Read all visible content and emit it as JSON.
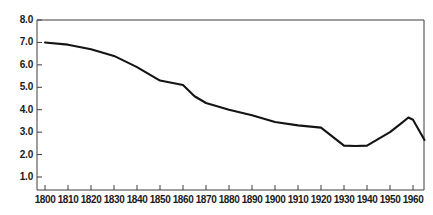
{
  "chart_data": {
    "type": "line",
    "title": "",
    "subtitle": "",
    "xlabel": "",
    "ylabel": "",
    "xlim": [
      1800,
      1965
    ],
    "ylim": [
      0.3,
      8.0
    ],
    "grid": false,
    "legend": null,
    "axis_color": "#3d3d3d",
    "line_color": "#141414",
    "background": "#ffffff",
    "yticks": [
      {
        "value": 8.0,
        "label": "8.0"
      },
      {
        "value": 7.0,
        "label": "7.0"
      },
      {
        "value": 6.0,
        "label": "6.0"
      },
      {
        "value": 5.0,
        "label": "5.0"
      },
      {
        "value": 4.0,
        "label": "4.0"
      },
      {
        "value": 3.0,
        "label": "3.0"
      },
      {
        "value": 2.0,
        "label": "2.0"
      },
      {
        "value": 1.0,
        "label": "1.0"
      }
    ],
    "xticks": [
      {
        "value": 1800,
        "label": "1800"
      },
      {
        "value": 1810,
        "label": "1810"
      },
      {
        "value": 1820,
        "label": "1820"
      },
      {
        "value": 1830,
        "label": "1830"
      },
      {
        "value": 1840,
        "label": "1840"
      },
      {
        "value": 1850,
        "label": "1850"
      },
      {
        "value": 1860,
        "label": "1860"
      },
      {
        "value": 1870,
        "label": "1870"
      },
      {
        "value": 1880,
        "label": "1880"
      },
      {
        "value": 1890,
        "label": "1890"
      },
      {
        "value": 1900,
        "label": "1900"
      },
      {
        "value": 1910,
        "label": "1910"
      },
      {
        "value": 1920,
        "label": "1920"
      },
      {
        "value": 1930,
        "label": "1930"
      },
      {
        "value": 1940,
        "label": "1940"
      },
      {
        "value": 1950,
        "label": "1950"
      },
      {
        "value": 1960,
        "label": "1960"
      }
    ],
    "series": [
      {
        "name": "rate",
        "x": [
          1800,
          1810,
          1820,
          1830,
          1840,
          1850,
          1855,
          1860,
          1865,
          1870,
          1880,
          1890,
          1900,
          1910,
          1920,
          1925,
          1930,
          1935,
          1940,
          1945,
          1950,
          1955,
          1958,
          1960,
          1965
        ],
        "values": [
          7.0,
          6.9,
          6.7,
          6.4,
          5.9,
          5.3,
          5.2,
          5.1,
          4.6,
          4.3,
          4.0,
          3.75,
          3.45,
          3.3,
          3.2,
          2.8,
          2.4,
          2.38,
          2.4,
          2.7,
          3.0,
          3.4,
          3.65,
          3.55,
          2.65
        ]
      }
    ]
  }
}
